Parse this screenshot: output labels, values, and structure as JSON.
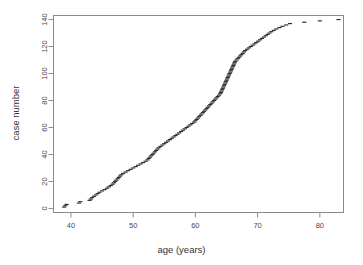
{
  "figure": {
    "background_color": "#ffffff",
    "plot_frame_color": "#8a8a8a",
    "marker_color": "#2b2b2b",
    "marker_symbol": "dash"
  },
  "chart_data": {
    "type": "scatter",
    "title": "",
    "subtitle": "",
    "xlabel": "age (years)",
    "ylabel": "case number",
    "xlim": [
      37.2,
      83.8
    ],
    "ylim": [
      -3,
      143
    ],
    "xticks": [
      40,
      50,
      60,
      70,
      80
    ],
    "xticklabels": [
      "40",
      "50",
      "60",
      "70",
      "80"
    ],
    "yticks": [
      0,
      20,
      40,
      60,
      80,
      100,
      120,
      140
    ],
    "yticklabels": [
      "0",
      "20",
      "40",
      "60",
      "80",
      "100",
      "120",
      "140"
    ],
    "grid": false,
    "legend": null,
    "legend_position": "none",
    "annotations": [],
    "series": [
      {
        "name": "cases ordered by age",
        "marker": "dash",
        "color": "#2b2b2b",
        "x": [
          38.9,
          39.1,
          39.3,
          41.3,
          41.5,
          43.0,
          43.2,
          43.4,
          43.7,
          44.0,
          44.3,
          44.6,
          45.0,
          45.4,
          45.8,
          46.1,
          46.4,
          46.7,
          46.9,
          47.1,
          47.3,
          47.5,
          47.7,
          47.9,
          48.1,
          48.4,
          48.8,
          49.2,
          49.6,
          50.0,
          50.4,
          50.8,
          51.2,
          51.6,
          52.0,
          52.3,
          52.5,
          52.7,
          52.9,
          53.1,
          53.3,
          53.5,
          53.7,
          53.9,
          54.1,
          54.4,
          54.7,
          55.0,
          55.3,
          55.6,
          55.9,
          56.2,
          56.5,
          56.8,
          57.1,
          57.4,
          57.7,
          58.0,
          58.3,
          58.6,
          58.9,
          59.2,
          59.5,
          59.8,
          60.0,
          60.2,
          60.4,
          60.6,
          60.8,
          61.0,
          61.2,
          61.4,
          61.6,
          61.8,
          62.0,
          62.2,
          62.4,
          62.6,
          62.8,
          63.0,
          63.2,
          63.4,
          63.6,
          63.8,
          64.0,
          64.1,
          64.2,
          64.3,
          64.4,
          64.5,
          64.6,
          64.7,
          64.8,
          64.9,
          65.0,
          65.1,
          65.2,
          65.3,
          65.4,
          65.5,
          65.6,
          65.7,
          65.8,
          65.9,
          66.0,
          66.1,
          66.2,
          66.3,
          66.4,
          66.6,
          66.8,
          67.0,
          67.2,
          67.4,
          67.6,
          67.8,
          68.0,
          68.3,
          68.6,
          68.9,
          69.2,
          69.5,
          69.8,
          70.1,
          70.4,
          70.7,
          71.0,
          71.3,
          71.6,
          71.9,
          72.2,
          72.6,
          73.0,
          73.5,
          74.0,
          74.6,
          75.2,
          77.5,
          80.0,
          83.0
        ],
        "y": [
          1,
          2,
          3,
          4,
          5,
          6,
          7,
          8,
          9,
          10,
          11,
          12,
          13,
          14,
          15,
          16,
          17,
          18,
          19,
          20,
          21,
          22,
          23,
          24,
          25,
          26,
          27,
          28,
          29,
          30,
          31,
          32,
          33,
          34,
          35,
          36,
          37,
          38,
          39,
          40,
          41,
          42,
          43,
          44,
          45,
          46,
          47,
          48,
          49,
          50,
          51,
          52,
          53,
          54,
          55,
          56,
          57,
          58,
          59,
          60,
          61,
          62,
          63,
          64,
          65,
          66,
          67,
          68,
          69,
          70,
          71,
          72,
          73,
          74,
          75,
          76,
          77,
          78,
          79,
          80,
          81,
          82,
          83,
          84,
          85,
          86,
          87,
          88,
          89,
          90,
          91,
          92,
          93,
          94,
          95,
          96,
          97,
          98,
          99,
          100,
          101,
          102,
          103,
          104,
          105,
          106,
          107,
          108,
          109,
          110,
          111,
          112,
          113,
          114,
          115,
          116,
          117,
          118,
          119,
          120,
          121,
          122,
          123,
          124,
          125,
          126,
          127,
          128,
          129,
          130,
          131,
          132,
          133,
          134,
          135,
          136,
          137,
          138,
          139,
          140
        ]
      }
    ]
  }
}
